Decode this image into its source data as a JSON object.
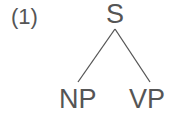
{
  "example_number": "(1)",
  "tree": {
    "root": "S",
    "children": [
      "NP",
      "VP"
    ]
  }
}
